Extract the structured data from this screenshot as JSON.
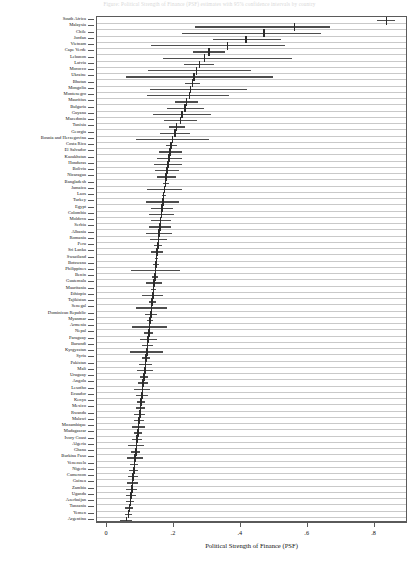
{
  "figure": {
    "title": "Figure: Political Strength of Finance (PSF) estimates with 95% confidence intervals by country",
    "xlabel": "Political Strength of Finance (PSF)"
  },
  "chart_data": {
    "type": "scatter",
    "subtype": "forest-plot",
    "title": "",
    "xlabel": "Political Strength of Finance (PSF)",
    "ylabel": "",
    "xlim": [
      -0.03,
      0.9
    ],
    "xticks": [
      0,
      0.2,
      0.4,
      0.6,
      0.8
    ],
    "xticklabels": [
      "0",
      ".2",
      ".4",
      ".6",
      ".8"
    ],
    "grid": "horizontal",
    "legend": "none",
    "error_bar_type": "confidence interval",
    "categories": [
      "South Africa",
      "Malaysia",
      "Chile",
      "Jordan",
      "Vietnam",
      "Cape Verde",
      "Lebanon",
      "Latvia",
      "Morocco",
      "Ukraine",
      "Bhutan",
      "Mongolia",
      "Montenegro",
      "Mauritius",
      "Bulgaria",
      "Guyana",
      "Macedonia",
      "Tunisia",
      "Georgia",
      "Bosnia and Herzegovina",
      "Costa Rica",
      "El Salvador",
      "Kazakhstan",
      "Honduras",
      "Bolivia",
      "Nicaragua",
      "Bangladesh",
      "Jamaica",
      "Laos",
      "Turkey",
      "Egypt",
      "Colombia",
      "Moldova",
      "Serbia",
      "Albania",
      "Romania",
      "Peru",
      "Sri Lanka",
      "Swaziland",
      "Botswana",
      "Philippines",
      "Benin",
      "Guatemala",
      "Mauritania",
      "Ethiopia",
      "Tajikistan",
      "Senegal",
      "Dominican Republic",
      "Myanmar",
      "Armenia",
      "Nepal",
      "Paraguay",
      "Burundi",
      "Kyrgyzstan",
      "Syria",
      "Pakistan",
      "Mali",
      "Uruguay",
      "Angola",
      "Lesotho",
      "Ecuador",
      "Kenya",
      "Mexico",
      "Rwanda",
      "Malawi",
      "Mozambique",
      "Madagascar",
      "Ivory Coast",
      "Algeria",
      "Ghana",
      "Burkina Faso",
      "Venezuela",
      "Nigeria",
      "Cameroon",
      "Guinea",
      "Zambia",
      "Uganda",
      "Azerbaijan",
      "Tanzania",
      "Yemen",
      "Argentina"
    ],
    "values": [
      0.836,
      0.56,
      0.47,
      0.415,
      0.36,
      0.305,
      0.292,
      0.276,
      0.268,
      0.26,
      0.255,
      0.25,
      0.247,
      0.238,
      0.233,
      0.224,
      0.219,
      0.208,
      0.203,
      0.196,
      0.192,
      0.189,
      0.186,
      0.182,
      0.18,
      0.177,
      0.175,
      0.172,
      0.169,
      0.167,
      0.165,
      0.163,
      0.16,
      0.158,
      0.156,
      0.154,
      0.152,
      0.15,
      0.148,
      0.146,
      0.145,
      0.143,
      0.141,
      0.139,
      0.137,
      0.135,
      0.133,
      0.131,
      0.129,
      0.127,
      0.125,
      0.123,
      0.121,
      0.119,
      0.117,
      0.115,
      0.113,
      0.11,
      0.108,
      0.106,
      0.104,
      0.102,
      0.1,
      0.098,
      0.096,
      0.094,
      0.092,
      0.09,
      0.088,
      0.086,
      0.084,
      0.082,
      0.08,
      0.078,
      0.076,
      0.074,
      0.072,
      0.07,
      0.067,
      0.064,
      0.058
    ],
    "ci_low": [
      0.806,
      0.263,
      0.225,
      0.318,
      0.132,
      0.258,
      0.168,
      0.23,
      0.122,
      0.057,
      0.232,
      0.128,
      0.119,
      0.204,
      0.178,
      0.137,
      0.17,
      0.185,
      0.158,
      0.088,
      0.176,
      0.155,
      0.148,
      0.14,
      0.144,
      0.148,
      0.166,
      0.12,
      0.163,
      0.118,
      0.132,
      0.125,
      0.13,
      0.124,
      0.118,
      0.129,
      0.14,
      0.132,
      0.143,
      0.138,
      0.072,
      0.134,
      0.118,
      0.131,
      0.106,
      0.125,
      0.088,
      0.114,
      0.12,
      0.076,
      0.112,
      0.098,
      0.105,
      0.07,
      0.104,
      0.095,
      0.09,
      0.098,
      0.092,
      0.082,
      0.086,
      0.09,
      0.086,
      0.082,
      0.08,
      0.074,
      0.08,
      0.076,
      0.064,
      0.072,
      0.06,
      0.07,
      0.066,
      0.062,
      0.06,
      0.058,
      0.056,
      0.058,
      0.055,
      0.054,
      0.04
    ],
    "ci_high": [
      0.86,
      0.666,
      0.64,
      0.52,
      0.532,
      0.352,
      0.552,
      0.32,
      0.43,
      0.495,
      0.278,
      0.42,
      0.365,
      0.272,
      0.29,
      0.312,
      0.268,
      0.232,
      0.248,
      0.305,
      0.208,
      0.223,
      0.224,
      0.224,
      0.216,
      0.206,
      0.184,
      0.225,
      0.175,
      0.216,
      0.198,
      0.201,
      0.19,
      0.192,
      0.194,
      0.179,
      0.164,
      0.168,
      0.153,
      0.154,
      0.218,
      0.152,
      0.164,
      0.147,
      0.168,
      0.145,
      0.178,
      0.148,
      0.138,
      0.178,
      0.138,
      0.148,
      0.137,
      0.168,
      0.13,
      0.135,
      0.136,
      0.122,
      0.124,
      0.13,
      0.122,
      0.114,
      0.114,
      0.114,
      0.112,
      0.114,
      0.104,
      0.104,
      0.112,
      0.1,
      0.108,
      0.094,
      0.094,
      0.094,
      0.092,
      0.09,
      0.088,
      0.082,
      0.079,
      0.074,
      0.076
    ]
  }
}
